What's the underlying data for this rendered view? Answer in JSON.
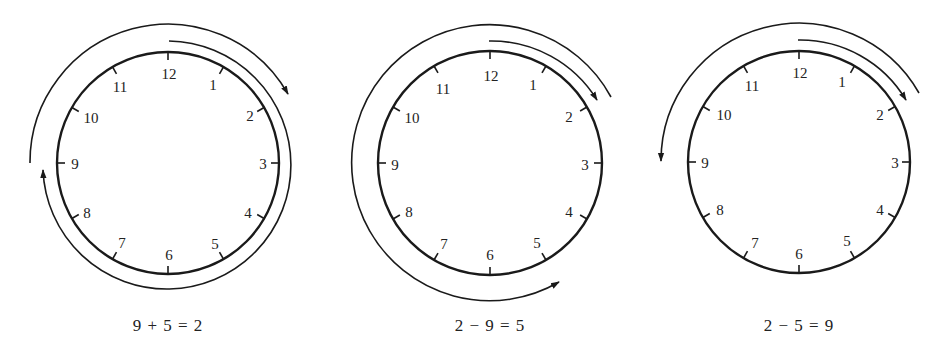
{
  "figure": {
    "clocks": [
      {
        "id": "clock-add",
        "caption": "9 + 5 = 2",
        "numbers": [
          "12",
          "1",
          "2",
          "3",
          "4",
          "5",
          "6",
          "7",
          "8",
          "9",
          "10",
          "11"
        ],
        "arcs": [
          {
            "from_hour": 12,
            "to_hour": 9,
            "direction": "clockwise",
            "meaning": "move 9 hours"
          },
          {
            "from_hour": 9,
            "to_hour": 2,
            "direction": "clockwise",
            "meaning": "add 5 hours"
          }
        ]
      },
      {
        "id": "clock-sub-1",
        "caption": "2 − 9 = 5",
        "numbers": [
          "12",
          "1",
          "2",
          "3",
          "4",
          "5",
          "6",
          "7",
          "8",
          "9",
          "10",
          "11"
        ],
        "arcs": [
          {
            "from_hour": 12,
            "to_hour": 2,
            "direction": "clockwise",
            "meaning": "move 2 hours"
          },
          {
            "from_hour": 2,
            "to_hour": 5,
            "direction": "counterclockwise",
            "meaning": "subtract 9 hours"
          }
        ]
      },
      {
        "id": "clock-sub-2",
        "caption": "2 − 5 = 9",
        "numbers": [
          "12",
          "1",
          "2",
          "3",
          "4",
          "5",
          "6",
          "7",
          "8",
          "9",
          "10",
          "11"
        ],
        "arcs": [
          {
            "from_hour": 12,
            "to_hour": 2,
            "direction": "clockwise",
            "meaning": "move 2 hours"
          },
          {
            "from_hour": 2,
            "to_hour": 9,
            "direction": "counterclockwise",
            "meaning": "subtract 5 hours"
          }
        ]
      }
    ]
  }
}
